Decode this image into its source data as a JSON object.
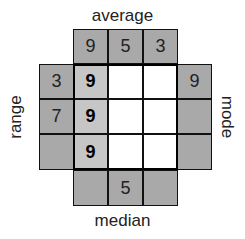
{
  "puzzle": {
    "labels": {
      "top": "average",
      "bottom": "median",
      "left": "range",
      "right": "mode"
    },
    "clues": {
      "top": [
        "9",
        "5",
        "3"
      ],
      "bottom": [
        "",
        "5",
        ""
      ],
      "left": [
        "3",
        "7",
        ""
      ],
      "right": [
        "9",
        "",
        ""
      ]
    },
    "grid": [
      [
        "9",
        "",
        ""
      ],
      [
        "9",
        "",
        ""
      ],
      [
        "9",
        "",
        ""
      ]
    ],
    "colors": {
      "clue_cell": "#a9a9a9",
      "filled_cell": "#c6c6c6",
      "empty_cell": "#ffffff",
      "border": "#111111"
    }
  }
}
